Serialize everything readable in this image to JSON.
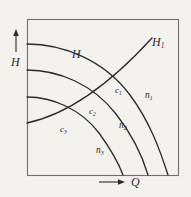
{
  "figure": {
    "type": "line-diagram",
    "background_color": "#f2f1ee",
    "line_color": "#2b2b2b",
    "frame": {
      "x": 27,
      "y": 19,
      "width": 151,
      "height": 156,
      "stroke_width": 1.1
    }
  },
  "axes": {
    "y": {
      "label": "H",
      "name": "head-axis",
      "arrow": "up",
      "arrow_x": 16,
      "arrow_top_y": 31,
      "arrow_bottom_y": 52,
      "label_x": 11,
      "label_y": 56
    },
    "x": {
      "label": "Q",
      "name": "discharge-axis",
      "arrow": "right",
      "arrow_left_x": 99,
      "arrow_right_x": 124,
      "arrow_y": 182,
      "label_x": 131,
      "label_y": 176
    }
  },
  "curves": [
    {
      "id": "h-curve-1",
      "label": "H",
      "series_label": "n",
      "series_sub": "1",
      "description": "uppermost pump head curve, speed n1",
      "start": [
        27,
        44
      ],
      "end": [
        168,
        175
      ],
      "path": "M27,44 C63,44 104,60 130,95 C150,122 160,150 168,175",
      "label_x": 72,
      "label_y": 48,
      "n_label_x": 145,
      "n_label_y": 91
    },
    {
      "id": "h-curve-2",
      "label": "",
      "series_label": "n",
      "series_sub": "2",
      "description": "middle pump head curve, speed n2",
      "start": [
        27,
        70
      ],
      "end": [
        148,
        175
      ],
      "path": "M27,70 C58,70 93,84 116,114 C134,137 143,158 148,175",
      "n_label_x": 119,
      "n_label_y": 121
    },
    {
      "id": "h-curve-3",
      "label": "",
      "series_label": "n",
      "series_sub": "3",
      "description": "lowest pump head curve, speed n3",
      "start": [
        27,
        97
      ],
      "end": [
        123,
        175
      ],
      "path": "M27,97 C52,97 81,109 99,133 C112,151 119,164 123,175",
      "n_label_x": 96,
      "n_label_y": 146
    }
  ],
  "system_curve": {
    "id": "system-curve",
    "label": "H",
    "label_sub": "1",
    "description": "rising system resistance curve H1",
    "path": "M27,123 C60,116 100,95 152,38",
    "label_x": 152,
    "label_y": 36
  },
  "operating_points": [
    {
      "id": "point-c1",
      "label": "c",
      "sub": "1",
      "description": "intersection of system curve H1 with curve n1",
      "label_x": 115,
      "label_y": 86
    },
    {
      "id": "point-c2",
      "label": "c",
      "sub": "2",
      "description": "intersection of system curve H1 with curve n2",
      "label_x": 89,
      "label_y": 107
    },
    {
      "id": "point-c3",
      "label": "c",
      "sub": "3",
      "description": "intersection of system curve H1 with curve n3",
      "label_x": 60,
      "label_y": 125
    }
  ]
}
